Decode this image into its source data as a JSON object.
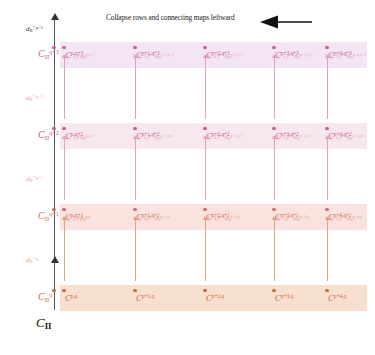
{
  "title": {
    "text": "Collapse rows and connecting maps leftward",
    "arrow_direction": "left"
  },
  "colors": {
    "band_row3": "#f3e6f2",
    "band_row2": "#f7e8f0",
    "band_row1": "#fae2de",
    "band_row0": "#f7e0cd",
    "node_row3": "#c064a0",
    "node_row2": "#d4568c",
    "node_row1": "#e0655f",
    "node_row0": "#d2663f",
    "axis": "#555555",
    "title_text": "#1a1a1a"
  },
  "axis": {
    "vertical_label_top": "d*,q+3",
    "bottom_object": "CII"
  },
  "axis_objects": [
    {
      "label_base": "C",
      "sub": "II",
      "sup": "q+3",
      "row": 3
    },
    {
      "label_base": "C",
      "sub": "II",
      "sup": "q+2",
      "row": 2
    },
    {
      "label_base": "C",
      "sub": "II",
      "sup": "q+1",
      "row": 1
    },
    {
      "label_base": "C",
      "sub": "II",
      "sup": "q",
      "row": 0
    }
  ],
  "axis_differentials": [
    {
      "base": "d",
      "sub": "II",
      "sup": "*,q+3",
      "row": 3
    },
    {
      "base": "d",
      "sub": "II",
      "sup": "*,q+2",
      "row": 2
    },
    {
      "base": "d",
      "sub": "II",
      "sup": "*,q+1",
      "row": 1
    },
    {
      "base": "d",
      "sub": "II",
      "sup": "*,q",
      "row": 0
    }
  ],
  "columns": [
    {
      "sup": "p,q"
    },
    {
      "sup": "p+1,q"
    },
    {
      "sup": "p+2,q"
    },
    {
      "sup": "p+3,q"
    },
    {
      "sup": "p+4,q"
    }
  ],
  "rows": [
    {
      "index": 3,
      "band_color": "#f3e6f2",
      "node_color": "#c064a0",
      "nodes": [
        {
          "base": "C",
          "sup": "p,q+3"
        },
        {
          "base": "C",
          "sup": "p+1,q+3"
        },
        {
          "base": "C",
          "sup": "p+2,q+3"
        },
        {
          "base": "C",
          "sup": "p+3,q+3"
        },
        {
          "base": "C",
          "sup": "p+4,q+3"
        }
      ]
    },
    {
      "index": 2,
      "band_color": "#f7e8f0",
      "node_color": "#d4568c",
      "nodes": [
        {
          "base": "C",
          "sup": "p,q+2"
        },
        {
          "base": "C",
          "sup": "p+1,q+2"
        },
        {
          "base": "C",
          "sup": "p+2,q+2"
        },
        {
          "base": "C",
          "sup": "p+3,q+2"
        },
        {
          "base": "C",
          "sup": "p+4,q+2"
        }
      ]
    },
    {
      "index": 1,
      "band_color": "#fae2de",
      "node_color": "#e0655f",
      "nodes": [
        {
          "base": "C",
          "sup": "p,q+1"
        },
        {
          "base": "C",
          "sup": "p+1,q+1"
        },
        {
          "base": "C",
          "sup": "p+2,q+1"
        },
        {
          "base": "C",
          "sup": "p+3,q+1"
        },
        {
          "base": "C",
          "sup": "p+4,q+1"
        }
      ]
    },
    {
      "index": 0,
      "band_color": "#f7e0cd",
      "node_color": "#d2663f",
      "nodes": [
        {
          "base": "C",
          "sup": "p,q"
        },
        {
          "base": "C",
          "sup": "p+1,q"
        },
        {
          "base": "C",
          "sup": "p+2,q"
        },
        {
          "base": "C",
          "sup": "p+3,q"
        },
        {
          "base": "C",
          "sup": "p+4,q"
        }
      ]
    }
  ],
  "differentials": [
    {
      "gap": 2,
      "color": "#e89bb8",
      "labels": [
        {
          "sign": "(-1)",
          "signexp": "p",
          "base": "d",
          "sub": "II",
          "sup": "p,q+2"
        },
        {
          "sign": "(-1)",
          "signexp": "p+1",
          "base": "d",
          "sub": "II",
          "sup": "p+1,q+2"
        },
        {
          "sign": "(-1)",
          "signexp": "p+2",
          "base": "d",
          "sub": "II",
          "sup": "p+2,q+2"
        },
        {
          "sign": "(-1)",
          "signexp": "p+3",
          "base": "d",
          "sub": "II",
          "sup": "p+3,q+2"
        },
        {
          "sign": "(-1)",
          "signexp": "p+4",
          "base": "d",
          "sub": "II",
          "sup": "p+4,q+2"
        }
      ]
    },
    {
      "gap": 1,
      "color": "#eba0ae",
      "labels": [
        {
          "sign": "(-1)",
          "signexp": "p",
          "base": "d",
          "sub": "II",
          "sup": "p,q+1"
        },
        {
          "sign": "(-1)",
          "signexp": "p+1",
          "base": "d",
          "sub": "II",
          "sup": "p+1,q+1"
        },
        {
          "sign": "(-1)",
          "signexp": "p+2",
          "base": "d",
          "sub": "II",
          "sup": "p+2,q+1"
        },
        {
          "sign": "(-1)",
          "signexp": "p+3",
          "base": "d",
          "sub": "II",
          "sup": "p+3,q+1"
        },
        {
          "sign": "(-1)",
          "signexp": "p+4",
          "base": "d",
          "sub": "II",
          "sup": "p+4,q+1"
        }
      ]
    },
    {
      "gap": 0,
      "color": "#d9a384",
      "labels": [
        {
          "sign": "(-1)",
          "signexp": "p",
          "base": "d",
          "sub": "II",
          "sup": "p,q"
        },
        {
          "sign": "(-1)",
          "signexp": "p+1",
          "base": "d",
          "sub": "II",
          "sup": "p+1,q"
        },
        {
          "sign": "(-1)",
          "signexp": "p+2",
          "base": "d",
          "sub": "II",
          "sup": "p+2,q"
        },
        {
          "sign": "(-1)",
          "signexp": "p+3",
          "base": "d",
          "sub": "II",
          "sup": "p+3,q"
        },
        {
          "sign": "(-1)",
          "signexp": "p+4",
          "base": "d",
          "sub": "II",
          "sup": "p+4,q"
        }
      ]
    }
  ]
}
